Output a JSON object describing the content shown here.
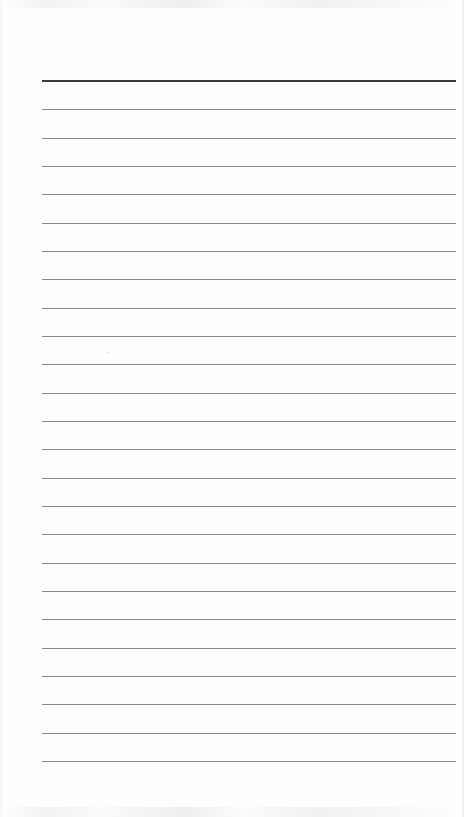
{
  "page": {
    "type": "lined-paper",
    "background": "#fefefe",
    "rules": {
      "count": 25,
      "x_start": 42,
      "x_end": 456,
      "first_y": 81,
      "spacing": 28.33,
      "top_rule_color": "#3c3c3c",
      "rule_color": "#8a8a8a",
      "positions_y": [
        81,
        109,
        138,
        166,
        194,
        223,
        251,
        279,
        308,
        336,
        364,
        393,
        421,
        449,
        478,
        506,
        534,
        563,
        591,
        619,
        648,
        676,
        704,
        733,
        761
      ]
    },
    "text_content": []
  }
}
